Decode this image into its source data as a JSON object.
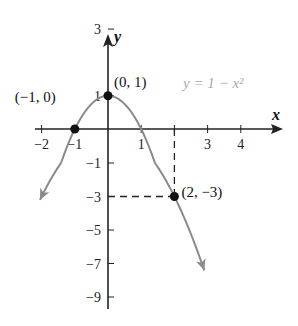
{
  "chart_data": {
    "type": "line",
    "title": "",
    "function": "y = 1 - x^2",
    "equation_label": "y = 1 − x²",
    "xlabel": "x",
    "ylabel": "y",
    "xlim": [
      -2.1,
      4.9
    ],
    "ylim": [
      -9.6,
      4.2
    ],
    "x_ticks": [
      -2,
      -1,
      1,
      2,
      3,
      4
    ],
    "x_tick_labels": [
      "−2",
      "−1",
      "1",
      "",
      "3",
      "4"
    ],
    "y_ticks": [
      3,
      1,
      -1,
      -3,
      -5,
      -7,
      -9
    ],
    "y_tick_labels": [
      "3",
      "1",
      "−1",
      "−3",
      "−5",
      "−7",
      "−9"
    ],
    "grid": false,
    "legend": null,
    "highlighted_points": [
      {
        "x": -1,
        "y": 0,
        "label": "(−1, 0)"
      },
      {
        "x": 0,
        "y": 1,
        "label": "(0, 1)"
      },
      {
        "x": 2,
        "y": -3,
        "label": "(2, −3)"
      }
    ],
    "dashed_guides": [
      {
        "from": [
          2,
          0
        ],
        "to": [
          2,
          -3
        ]
      },
      {
        "from": [
          0,
          -3
        ],
        "to": [
          2,
          -3
        ]
      }
    ],
    "curve_x_range": [
      -2.05,
      2.9
    ],
    "curve_color": "#8a8a8a",
    "axis_color": "#222222",
    "point_color": "#111111"
  }
}
